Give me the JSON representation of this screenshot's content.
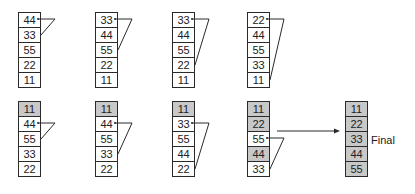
{
  "colors": {
    "sorted_fill": "#c8c8c8",
    "unsorted_fill": "#ffffff",
    "stroke": "#2a2a2a"
  },
  "passes": [
    {
      "row": 0,
      "col": 0,
      "values": [
        "44",
        "33",
        "55",
        "22",
        "11"
      ],
      "sorted": [
        false,
        false,
        false,
        false,
        false
      ],
      "swap": [
        0,
        1
      ]
    },
    {
      "row": 0,
      "col": 1,
      "values": [
        "33",
        "44",
        "55",
        "22",
        "11"
      ],
      "sorted": [
        false,
        false,
        false,
        false,
        false
      ],
      "swap": [
        0,
        2
      ]
    },
    {
      "row": 0,
      "col": 2,
      "values": [
        "33",
        "44",
        "55",
        "22",
        "11"
      ],
      "sorted": [
        false,
        false,
        false,
        false,
        false
      ],
      "swap": [
        0,
        3
      ]
    },
    {
      "row": 0,
      "col": 3,
      "values": [
        "22",
        "44",
        "55",
        "33",
        "11"
      ],
      "sorted": [
        false,
        false,
        false,
        false,
        false
      ],
      "swap": [
        0,
        4
      ]
    },
    {
      "row": 1,
      "col": 0,
      "values": [
        "11",
        "44",
        "55",
        "33",
        "22"
      ],
      "sorted": [
        true,
        false,
        false,
        false,
        false
      ],
      "swap": [
        1,
        2
      ]
    },
    {
      "row": 1,
      "col": 1,
      "values": [
        "11",
        "44",
        "55",
        "33",
        "22"
      ],
      "sorted": [
        true,
        false,
        false,
        false,
        false
      ],
      "swap": [
        1,
        3
      ]
    },
    {
      "row": 1,
      "col": 2,
      "values": [
        "11",
        "33",
        "55",
        "44",
        "22"
      ],
      "sorted": [
        true,
        false,
        false,
        false,
        false
      ],
      "swap": [
        1,
        4
      ]
    },
    {
      "row": 1,
      "col": 3,
      "values": [
        "11",
        "22",
        "55",
        "44",
        "33"
      ],
      "sorted": [
        true,
        true,
        false,
        true,
        false
      ],
      "swap": [
        2,
        4
      ]
    }
  ],
  "final": {
    "values": [
      "11",
      "22",
      "33",
      "44",
      "55"
    ],
    "label": "Final"
  }
}
